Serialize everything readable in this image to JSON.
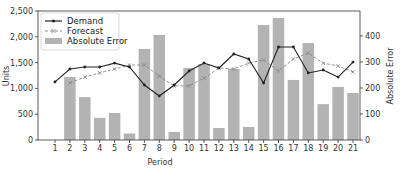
{
  "chart_data": {
    "type": "bar+line",
    "title": "",
    "xlabel": "Period",
    "ylabel": "Units",
    "y2label": "Absolute Error",
    "x": [
      1,
      2,
      3,
      4,
      5,
      6,
      7,
      8,
      9,
      10,
      11,
      12,
      13,
      14,
      15,
      16,
      17,
      18,
      19,
      20,
      21
    ],
    "ylim": [
      0,
      2500
    ],
    "y2lim": [
      0,
      496
    ],
    "yticks": [
      0,
      500,
      1000,
      1500,
      2000,
      2500
    ],
    "ytick_labels": [
      "0",
      "500",
      "1,000",
      "1,500",
      "2,000",
      "2,500"
    ],
    "y2ticks": [
      0,
      100,
      200,
      300,
      400
    ],
    "y2tick_labels": [
      "0",
      "100",
      "200",
      "300",
      "400"
    ],
    "grid": false,
    "legend_position": "upper left",
    "series": [
      {
        "name": "Demand",
        "type": "line",
        "axis": "left",
        "style": "solid",
        "marker": "dot",
        "color": "#222222",
        "values": [
          1125,
          1376,
          1415,
          1415,
          1490,
          1415,
          1066,
          853,
          1066,
          1337,
          1492,
          1395,
          1667,
          1570,
          1105,
          1802,
          1802,
          1300,
          1357,
          1220,
          1510
        ]
      },
      {
        "name": "Forecast",
        "type": "line",
        "axis": "left",
        "style": "dashed",
        "marker": "x",
        "color": "#888888",
        "values": [
          null,
          1105,
          1220,
          1300,
          1376,
          1453,
          1453,
          1240,
          1046,
          1050,
          1200,
          1395,
          1376,
          1490,
          1550,
          1337,
          1570,
          1686,
          1490,
          1434,
          1318
        ]
      },
      {
        "name": "Absolute Error",
        "type": "bar",
        "axis": "right",
        "color": "#b3b3b3",
        "values": [
          null,
          242,
          165,
          85,
          104,
          25,
          350,
          404,
          31,
          277,
          292,
          46,
          273,
          50,
          442,
          469,
          231,
          373,
          138,
          204,
          181
        ]
      }
    ]
  },
  "legend": {
    "items": [
      {
        "label": "Demand"
      },
      {
        "label": "Forecast"
      },
      {
        "label": "Absolute Error"
      }
    ]
  },
  "colors": {
    "demand": "#222222",
    "forecast": "#8c8c8c",
    "bars": "#b3b3b3",
    "axis": "#333333"
  }
}
